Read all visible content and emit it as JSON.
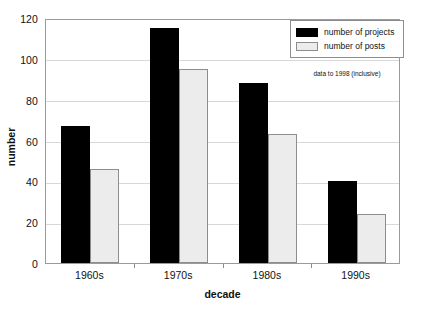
{
  "chart_data": {
    "type": "bar",
    "title": "",
    "subtitle": "",
    "xlabel": "decade",
    "ylabel": "number",
    "categories": [
      "1960s",
      "1970s",
      "1980s",
      "1990s"
    ],
    "series": [
      {
        "name": "number of projects",
        "values": [
          67,
          115,
          88,
          40
        ],
        "color": "#000000"
      },
      {
        "name": "number of posts",
        "values": [
          46,
          95,
          63,
          24
        ],
        "color": "#ececec"
      }
    ],
    "ylim": [
      0,
      120
    ],
    "ytick_step": 20,
    "yticks": [
      0,
      20,
      40,
      60,
      80,
      100,
      120
    ],
    "ytick_labels": [
      "0",
      "20",
      "40",
      "60",
      "80",
      "100",
      "120"
    ],
    "grid": true,
    "grid_axis": "y",
    "legend_position": "top-right",
    "annotations": [
      "data to 1998 (inclusive)"
    ]
  },
  "axes": {
    "y": {
      "title": "number",
      "tick_labels": [
        "0",
        "20",
        "40",
        "60",
        "80",
        "100",
        "120"
      ]
    },
    "x": {
      "title": "decade",
      "tick_labels": [
        "1960s",
        "1970s",
        "1980s",
        "1990s"
      ]
    }
  },
  "legend": {
    "entries": [
      {
        "label": "number of projects",
        "swatch": "black-square-swatch"
      },
      {
        "label": "number of posts",
        "swatch": "light-gray-square-swatch"
      }
    ]
  },
  "annotation": {
    "text": "data to 1998 (inclusive)"
  },
  "colors": {
    "projects": "#000000",
    "posts": "#ececec",
    "gridline": "#d8d8d8",
    "frame": "#9a9a9a",
    "background": "#ffffff"
  }
}
